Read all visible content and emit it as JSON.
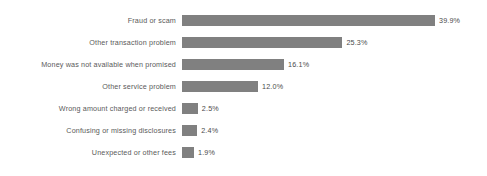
{
  "chart_data": {
    "type": "bar",
    "orientation": "horizontal",
    "title": "",
    "subtitle": "",
    "xlabel": "",
    "ylabel": "",
    "categories": [
      "Fraud or scam",
      "Other transaction problem",
      "Money was not available when promised",
      "Other service problem",
      "Wrong amount charged or received",
      "Confusing or missing disclosures",
      "Unexpected or other fees"
    ],
    "values": [
      39.9,
      25.3,
      16.1,
      12.0,
      2.5,
      2.4,
      1.9
    ],
    "value_labels": [
      "39.9%",
      "25.3%",
      "16.1%",
      "12.0%",
      "2.5%",
      "2.4%",
      "1.9%"
    ],
    "xlim": [
      0,
      39.9
    ],
    "grid": false,
    "legend": false,
    "legend_position": "none",
    "bar_color": "#808080",
    "background_color": "#ffffff",
    "label_color": "#5a5a5a",
    "value_color": "#4a4a4a"
  }
}
